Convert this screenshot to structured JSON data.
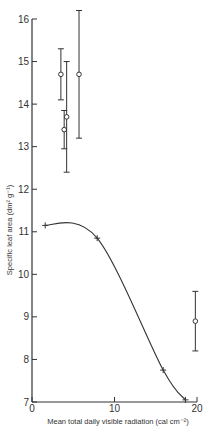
{
  "chart_data": {
    "type": "scatter",
    "title": "",
    "xlabel": "Mean total daily visible radiation (cal cm⁻²)",
    "ylabel": "Specific leaf area (dm² g⁻¹)",
    "xlim": [
      0,
      20
    ],
    "ylim": [
      7,
      16
    ],
    "x_ticks": [
      0,
      10,
      20
    ],
    "y_ticks": [
      7,
      8,
      9,
      10,
      11,
      12,
      13,
      14,
      15,
      16
    ],
    "grid": false,
    "legend": null,
    "series": [
      {
        "name": "open circles with error bars",
        "marker": "open-circle",
        "points": [
          {
            "x": 3.5,
            "y": 14.7,
            "ymin": 14.1,
            "ymax": 15.3
          },
          {
            "x": 3.9,
            "y": 13.4,
            "ymin": 12.95,
            "ymax": 13.85
          },
          {
            "x": 4.2,
            "y": 13.7,
            "ymin": 12.4,
            "ymax": 15.0
          },
          {
            "x": 5.7,
            "y": 14.7,
            "ymin": 13.2,
            "ymax": 16.2
          },
          {
            "x": 19.8,
            "y": 8.9,
            "ymin": 8.2,
            "ymax": 9.6
          }
        ]
      },
      {
        "name": "crosses with fitted curve",
        "marker": "cross",
        "line": "smooth",
        "points": [
          {
            "x": 1.6,
            "y": 11.15
          },
          {
            "x": 7.9,
            "y": 10.85
          },
          {
            "x": 15.9,
            "y": 7.75
          },
          {
            "x": 18.6,
            "y": 7.05
          }
        ]
      }
    ]
  },
  "labels": {
    "x_axis_title": "Mean total daily visible radiation (cal cm⁻²)",
    "y_axis_title": "Specific leaf area (dm² g⁻¹)",
    "x_ticks": [
      "0",
      "10",
      "20"
    ],
    "y_ticks": [
      "7",
      "8",
      "9",
      "10",
      "11",
      "12",
      "13",
      "14",
      "15",
      "16"
    ]
  },
  "colors": {
    "ink": "#333333",
    "background": "#ffffff"
  }
}
